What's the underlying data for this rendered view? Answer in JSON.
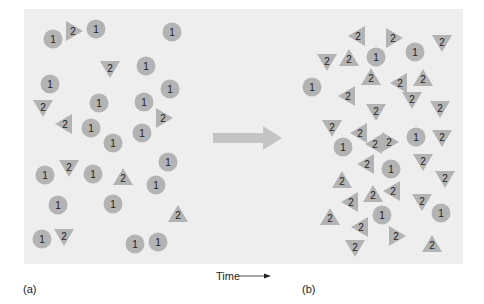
{
  "figure": {
    "panel_a_label": "(a)",
    "panel_b_label": "(b)",
    "time_label": "Time",
    "colors": {
      "background": "#eeeeee",
      "particle_fill": "#b3b3b3",
      "arrow_fill": "#c4c4c4",
      "text": "#222222"
    },
    "particle_types": {
      "circle": "1",
      "triangle": "2"
    },
    "panel_a": {
      "circles": [
        [
          53,
          39
        ],
        [
          96,
          29
        ],
        [
          172,
          32
        ],
        [
          146,
          66
        ],
        [
          50,
          84
        ],
        [
          170,
          89
        ],
        [
          99,
          103
        ],
        [
          144,
          102
        ],
        [
          91,
          128
        ],
        [
          142,
          133
        ],
        [
          113,
          143
        ],
        [
          45,
          175
        ],
        [
          93,
          174
        ],
        [
          168,
          162
        ],
        [
          156,
          185
        ],
        [
          58,
          205
        ],
        [
          113,
          204
        ],
        [
          42,
          239
        ],
        [
          135,
          244
        ],
        [
          158,
          242
        ]
      ],
      "triangles": [
        [
          73,
          31,
          "right"
        ],
        [
          110,
          68,
          "down"
        ],
        [
          43,
          107,
          "down"
        ],
        [
          65,
          124,
          "left"
        ],
        [
          163,
          118,
          "right"
        ],
        [
          69,
          167,
          "down"
        ],
        [
          123,
          178,
          "up"
        ],
        [
          178,
          215,
          "up"
        ],
        [
          64,
          236,
          "down"
        ]
      ]
    },
    "panel_b": {
      "circles": [
        [
          376,
          57
        ],
        [
          415,
          52
        ],
        [
          312,
          87
        ],
        [
          416,
          137
        ],
        [
          343,
          147
        ],
        [
          391,
          169
        ],
        [
          382,
          215
        ],
        [
          441,
          213
        ]
      ],
      "triangles": [
        [
          358,
          36,
          "left"
        ],
        [
          393,
          38,
          "right"
        ],
        [
          442,
          42,
          "down"
        ],
        [
          327,
          61,
          "down"
        ],
        [
          349,
          59,
          "up"
        ],
        [
          371,
          78,
          "up"
        ],
        [
          400,
          83,
          "left"
        ],
        [
          423,
          79,
          "up"
        ],
        [
          348,
          96,
          "left"
        ],
        [
          412,
          99,
          "down"
        ],
        [
          440,
          108,
          "down"
        ],
        [
          376,
          111,
          "down"
        ],
        [
          332,
          127,
          "down"
        ],
        [
          360,
          133,
          "left"
        ],
        [
          375,
          144,
          "left"
        ],
        [
          389,
          142,
          "right"
        ],
        [
          442,
          137,
          "down"
        ],
        [
          367,
          164,
          "left"
        ],
        [
          423,
          161,
          "down"
        ],
        [
          342,
          181,
          "up"
        ],
        [
          445,
          178,
          "down"
        ],
        [
          373,
          195,
          "up"
        ],
        [
          393,
          191,
          "left"
        ],
        [
          351,
          202,
          "left"
        ],
        [
          422,
          201,
          "down"
        ],
        [
          330,
          218,
          "up"
        ],
        [
          361,
          227,
          "left"
        ],
        [
          396,
          236,
          "right"
        ],
        [
          355,
          247,
          "down"
        ],
        [
          432,
          245,
          "up"
        ]
      ]
    }
  }
}
